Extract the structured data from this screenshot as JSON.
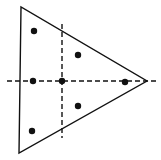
{
  "diagram": {
    "type": "triangle-with-symmetry-axes",
    "colors": {
      "stroke": "#111111",
      "background": "#ffffff",
      "dot": "#111111"
    },
    "triangle": {
      "vertices": [
        [
          21,
          7
        ],
        [
          19,
          153
        ],
        [
          147,
          81
        ]
      ]
    },
    "axes": [
      {
        "id": "horizontal-axis",
        "style": "dashed",
        "x1": 7,
        "y1": 81,
        "x2": 158,
        "y2": 81
      },
      {
        "id": "vertical-axis",
        "style": "dashed",
        "x1": 62,
        "y1": 24,
        "x2": 62,
        "y2": 138
      }
    ],
    "points": [
      {
        "id": "p1",
        "x": 34,
        "y": 31
      },
      {
        "id": "p2",
        "x": 78,
        "y": 55
      },
      {
        "id": "p3",
        "x": 33,
        "y": 81
      },
      {
        "id": "p4",
        "x": 62,
        "y": 81
      },
      {
        "id": "p5",
        "x": 125,
        "y": 82
      },
      {
        "id": "p6",
        "x": 78,
        "y": 106
      },
      {
        "id": "p7",
        "x": 32,
        "y": 131
      }
    ]
  }
}
